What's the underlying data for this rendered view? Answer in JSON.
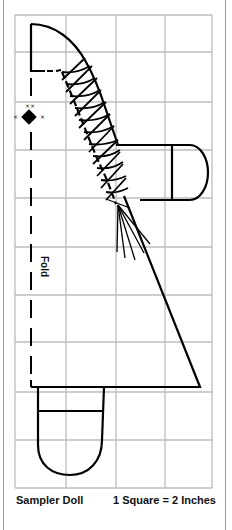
{
  "pattern": {
    "title": "Sampler Doll",
    "scale": "1 Square = 2 Inches",
    "fold_label": "Fold",
    "grid": {
      "columns": 4,
      "rows": 10,
      "x_lines": [
        15,
        66,
        116,
        165,
        212
      ],
      "y_lines": [
        15,
        52,
        102,
        150,
        198,
        247,
        295,
        342,
        392,
        440,
        488
      ],
      "line_color": "#bdbdbd"
    },
    "line_color": "#000000",
    "pieces": [
      "head",
      "body",
      "arm",
      "skirt",
      "leg",
      "tassel",
      "embroidery-star"
    ]
  }
}
